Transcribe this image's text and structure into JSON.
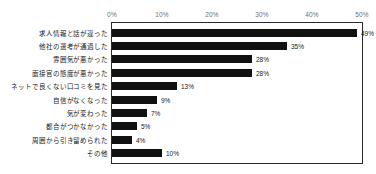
{
  "chart_data": {
    "type": "bar",
    "orientation": "horizontal",
    "title": "",
    "subtitle": "",
    "xlabel": "",
    "ylabel": "",
    "xlim": [
      0,
      50
    ],
    "grid": false,
    "legend": null,
    "axis": {
      "ticks": [
        0,
        10,
        20,
        30,
        40,
        50
      ],
      "tick_labels": [
        "0%",
        "10%",
        "20%",
        "30%",
        "40%",
        "50%"
      ],
      "position": "top",
      "unit": "%"
    },
    "categories": [
      "求人情報と話が違った",
      "他社の選考が通過した",
      "雰囲気が悪かった",
      "面接官の態度が悪かった",
      "ネットで良くない口コミを見た",
      "自信がなくなった",
      "気が変わった",
      "都合がつかなかった",
      "周囲から引き留められた",
      "その他"
    ],
    "values": [
      49,
      35,
      28,
      28,
      13,
      9,
      7,
      5,
      4,
      10
    ],
    "data_labels": [
      "49%",
      "35%",
      "28%",
      "28%",
      "13%",
      "9%",
      "7%",
      "5%",
      "4%",
      "10%"
    ],
    "colors": {
      "bar": "#111111",
      "axis_text": "#6e6e6e",
      "label_text": "#1a1a1a",
      "frame": "#2b2b2b",
      "background": "#ffffff"
    }
  }
}
